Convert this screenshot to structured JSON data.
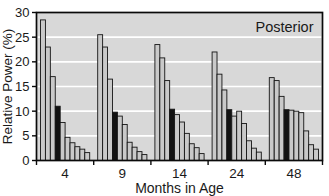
{
  "figure": {
    "kind": "grouped bar chart",
    "corner_label": "Posterior"
  },
  "colors": {
    "plot_background": "#d8d8d8",
    "frame": "#0a0a0a",
    "gridline": "#ffffff",
    "bar_default": "#c9c9c9",
    "bar_highlight": "#121212",
    "bar_outline": "#141414",
    "text": "#1a1a1a",
    "page_background": "#ffffff"
  },
  "chart_data": {
    "type": "bar",
    "title": "Posterior",
    "title_position": "top-right inside plot",
    "xlabel": "Months in Age",
    "ylabel": "Relative Power (%)",
    "ylim": [
      0,
      30
    ],
    "yticks": [
      0,
      5,
      10,
      15,
      20,
      25,
      30
    ],
    "gridlines_at": [
      5,
      10,
      15,
      20,
      25
    ],
    "grid_style": "white horizontal lines behind bars",
    "legend_position": "none",
    "categories": [
      "4",
      "9",
      "14",
      "24",
      "48"
    ],
    "bars_per_group": 10,
    "highlight_bar_index": 3,
    "highlight_meaning": "fourth bar of each group is solid black",
    "groups": [
      {
        "category": "4",
        "values": [
          28.5,
          23.0,
          17.0,
          11.0,
          7.7,
          4.7,
          3.6,
          2.8,
          2.3,
          1.6
        ]
      },
      {
        "category": "9",
        "values": [
          25.5,
          23.0,
          16.5,
          9.8,
          9.0,
          7.3,
          3.7,
          2.7,
          1.8,
          1.2
        ]
      },
      {
        "category": "14",
        "values": [
          23.5,
          20.8,
          16.2,
          10.4,
          9.3,
          7.8,
          5.5,
          3.4,
          2.6,
          1.4
        ]
      },
      {
        "category": "24",
        "values": [
          22.0,
          17.5,
          14.3,
          10.3,
          9.0,
          10.0,
          7.5,
          4.0,
          2.5,
          1.7
        ]
      },
      {
        "category": "48",
        "values": [
          16.8,
          16.2,
          13.0,
          10.3,
          10.2,
          10.0,
          9.7,
          6.0,
          3.2,
          2.3
        ]
      }
    ]
  }
}
